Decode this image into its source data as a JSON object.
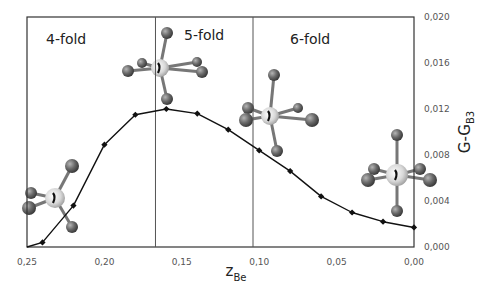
{
  "chart_data": {
    "type": "line",
    "title": "",
    "xlabel": "z_Be",
    "xlabel_main": "z",
    "xlabel_sub": "Be",
    "ylabel": "G-G_B3",
    "ylabel_main": "G-G",
    "ylabel_sub": "B3",
    "xlim": [
      0.25,
      0.0
    ],
    "ylim": [
      0.0,
      0.02
    ],
    "x_reversed": true,
    "y_axis_position": "right",
    "grid": false,
    "legend": null,
    "x_ticks": [
      "0,25",
      "0,20",
      "0,15",
      "0,10",
      "0,05",
      "0,00"
    ],
    "x_tick_values": [
      0.25,
      0.2,
      0.15,
      0.1,
      0.05,
      0.0
    ],
    "y_ticks": [
      "0,000",
      "0,004",
      "0,008",
      "0,012",
      "0,016",
      "0,020"
    ],
    "y_tick_values": [
      0.0,
      0.004,
      0.008,
      0.012,
      0.016,
      0.02
    ],
    "series": [
      {
        "name": "G-G_B3",
        "x": [
          0.25,
          0.24,
          0.22,
          0.2,
          0.18,
          0.16,
          0.14,
          0.12,
          0.1,
          0.08,
          0.06,
          0.04,
          0.02,
          0.0
        ],
        "values": [
          0.0,
          0.0004,
          0.0036,
          0.0089,
          0.0115,
          0.012,
          0.0116,
          0.0102,
          0.0084,
          0.0066,
          0.0044,
          0.003,
          0.0022,
          0.0017
        ]
      }
    ],
    "regions": [
      {
        "label": "4-fold",
        "x_from": 0.25,
        "x_to": 0.167
      },
      {
        "label": "5-fold",
        "x_from": 0.167,
        "x_to": 0.104
      },
      {
        "label": "6-fold",
        "x_from": 0.104,
        "x_to": 0.0
      }
    ],
    "dividers": [
      0.167,
      0.104
    ],
    "annotations": [
      {
        "type": "molecule-icon",
        "coordination": "4-fold",
        "at_x": 0.24
      },
      {
        "type": "molecule-icon",
        "coordination": "5-fold",
        "at_x": 0.165
      },
      {
        "type": "molecule-icon",
        "coordination": "6-fold",
        "at_x": 0.1
      },
      {
        "type": "molecule-icon",
        "coordination": "6-fold-octahedral",
        "at_x": 0.01
      }
    ]
  },
  "colors": {
    "line": "#111111",
    "axis": "#333333",
    "divider": "#555555",
    "atom_dark": "#6e6e6e",
    "atom_light": "#d6d6d6"
  }
}
